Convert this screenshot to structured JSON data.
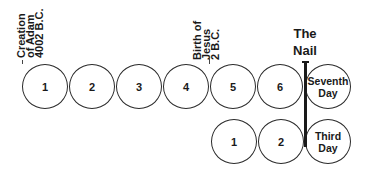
{
  "diagram": {
    "top_row": [
      {
        "label": "1"
      },
      {
        "label": "2"
      },
      {
        "label": "3"
      },
      {
        "label": "4"
      },
      {
        "label": "5"
      },
      {
        "label": "6"
      },
      {
        "label_line1": "Seventh",
        "label_line2": "Day"
      }
    ],
    "bottom_row": [
      {
        "label": "1"
      },
      {
        "label": "2"
      },
      {
        "label_line1": "Third",
        "label_line2": "Day"
      }
    ],
    "annotations": {
      "creation": {
        "line1": "Creation",
        "line2": "of Adam",
        "line3": "4002 B.C."
      },
      "birth": {
        "line1": "Birth of",
        "line2": "Jesus",
        "line3": "2 B.C."
      },
      "nail": {
        "line1": "The",
        "line2": "Nail"
      }
    }
  }
}
